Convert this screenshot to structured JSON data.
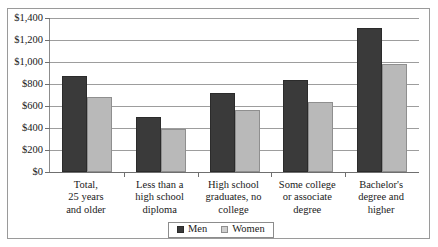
{
  "chart_data": {
    "type": "bar",
    "title": "",
    "subtitle": "",
    "xlabel": "",
    "ylabel": "",
    "ylim": [
      0,
      1400
    ],
    "ytick_step": 200,
    "grid": true,
    "legend_position": "bottom-center",
    "value_prefix": "$",
    "categories": [
      "Total,\n25 years\nand older",
      "Less than a\nhigh school\ndiploma",
      "High school\ngraduates, no\ncollege",
      "Some college\nor associate\ndegree",
      "Bachelor's\ndegree and\nhigher"
    ],
    "ytick_labels": [
      "$0",
      "$200",
      "$400",
      "$600",
      "$800",
      "$1,000",
      "$1,200",
      "$1,400"
    ],
    "ytick_values": [
      0,
      200,
      400,
      600,
      800,
      1000,
      1200,
      1400
    ],
    "series": [
      {
        "name": "Men",
        "color": "#3a3a3a",
        "values": [
          870,
          500,
          715,
          840,
          1310
        ]
      },
      {
        "name": "Women",
        "color": "#b9b9b9",
        "values": [
          685,
          390,
          565,
          640,
          985
        ]
      }
    ]
  },
  "legend": {
    "items": [
      {
        "label": "Men",
        "swatch": "men"
      },
      {
        "label": "Women",
        "swatch": "women"
      }
    ]
  },
  "categories_display": [
    {
      "line1": "Total,",
      "line2": "25 years",
      "line3": "and older"
    },
    {
      "line1": "Less than a",
      "line2": "high school",
      "line3": "diploma"
    },
    {
      "line1": "High school",
      "line2": "graduates, no",
      "line3": "college"
    },
    {
      "line1": "Some college",
      "line2": "or associate",
      "line3": "degree"
    },
    {
      "line1": "Bachelor's",
      "line2": "degree and",
      "line3": "higher"
    }
  ]
}
